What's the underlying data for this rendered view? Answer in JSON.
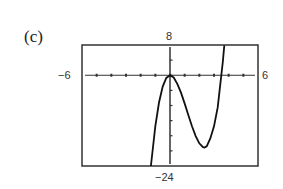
{
  "panel_label": "(c)",
  "window": {
    "xmin_label": "−6",
    "xmax_label": "6",
    "ymax_label": "8",
    "ymin_label": "−24"
  },
  "chart_data": {
    "type": "line",
    "title": "",
    "xlabel": "",
    "ylabel": "",
    "xlim": [
      -6,
      6
    ],
    "ylim": [
      -24,
      8
    ],
    "x_tick_step": 1,
    "y_tick_step": 4,
    "grid": false,
    "legend": null,
    "axis_labels": {
      "left": "−6",
      "right": "6",
      "top": "8",
      "bottom": "−24"
    },
    "series": [
      {
        "name": "f(x)",
        "description": "cubic-like curve: rises to local max at (0,0), falls to local min near (2.35,-19), crosses zero near x=3.5, exits top near x=3.7",
        "x": [
          -1.3,
          -1.0,
          -0.75,
          -0.5,
          -0.25,
          0,
          0.25,
          0.5,
          0.75,
          1.0,
          1.25,
          1.5,
          1.75,
          2.0,
          2.25,
          2.35,
          2.5,
          2.75,
          3.0,
          3.25,
          3.5,
          3.6,
          3.7
        ],
        "y": [
          -24.3,
          -13.5,
          -7.2,
          -3.0,
          -0.7,
          0,
          -0.6,
          -2.3,
          -4.6,
          -7.5,
          -10.5,
          -13.5,
          -16.1,
          -18.0,
          -19.0,
          -19.1,
          -18.8,
          -16.7,
          -13.5,
          -8.5,
          0.0,
          3.5,
          7.9
        ]
      }
    ]
  }
}
